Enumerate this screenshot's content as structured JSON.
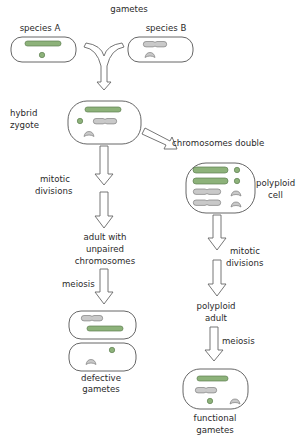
{
  "diagram": {
    "type": "flowchart",
    "topic": "polyploid speciation via hybridization",
    "colors": {
      "chromosome_species_a": "#8db27a",
      "chromosome_species_b": "#c9c9c9",
      "outline": "#555555",
      "text": "#2a2a2a"
    },
    "labels": {
      "gametes": "gametes",
      "species_a": "species A",
      "species_b": "species B",
      "hybrid_zygote_1": "hybrid",
      "hybrid_zygote_2": "zygote",
      "chromosomes_double": "chromosomes double",
      "polyploid_cell_1": "polyploid",
      "polyploid_cell_2": "cell",
      "mitotic_left_1": "mitotic",
      "mitotic_left_2": "divisions",
      "adult_unpaired_1": "adult with",
      "adult_unpaired_2": "unpaired",
      "adult_unpaired_3": "chromosomes",
      "meiosis_left": "meiosis",
      "defective_1": "defective",
      "defective_2": "gametes",
      "mitotic_right_1": "mitotic",
      "mitotic_right_2": "divisions",
      "polyploid_adult_1": "polyploid",
      "polyploid_adult_2": "adult",
      "meiosis_right": "meiosis",
      "functional_1": "functional",
      "functional_2": "gametes"
    },
    "nodes": [
      {
        "id": "species_a_gamete",
        "label": "species A"
      },
      {
        "id": "species_b_gamete",
        "label": "species B"
      },
      {
        "id": "hybrid_zygote",
        "label": "hybrid zygote"
      },
      {
        "id": "adult_unpaired",
        "label": "adult with unpaired chromosomes"
      },
      {
        "id": "defective_gametes",
        "label": "defective gametes"
      },
      {
        "id": "polyploid_cell",
        "label": "polyploid cell"
      },
      {
        "id": "polyploid_adult",
        "label": "polyploid adult"
      },
      {
        "id": "functional_gametes",
        "label": "functional gametes"
      }
    ],
    "edges": [
      {
        "from": "species_a_gamete",
        "to": "hybrid_zygote",
        "label": "gametes"
      },
      {
        "from": "species_b_gamete",
        "to": "hybrid_zygote",
        "label": "gametes"
      },
      {
        "from": "hybrid_zygote",
        "to": "adult_unpaired",
        "label": "mitotic divisions"
      },
      {
        "from": "adult_unpaired",
        "to": "defective_gametes",
        "label": "meiosis"
      },
      {
        "from": "hybrid_zygote",
        "to": "polyploid_cell",
        "label": "chromosomes double"
      },
      {
        "from": "polyploid_cell",
        "to": "polyploid_adult",
        "label": "mitotic divisions"
      },
      {
        "from": "polyploid_adult",
        "to": "functional_gametes",
        "label": "meiosis"
      }
    ]
  }
}
